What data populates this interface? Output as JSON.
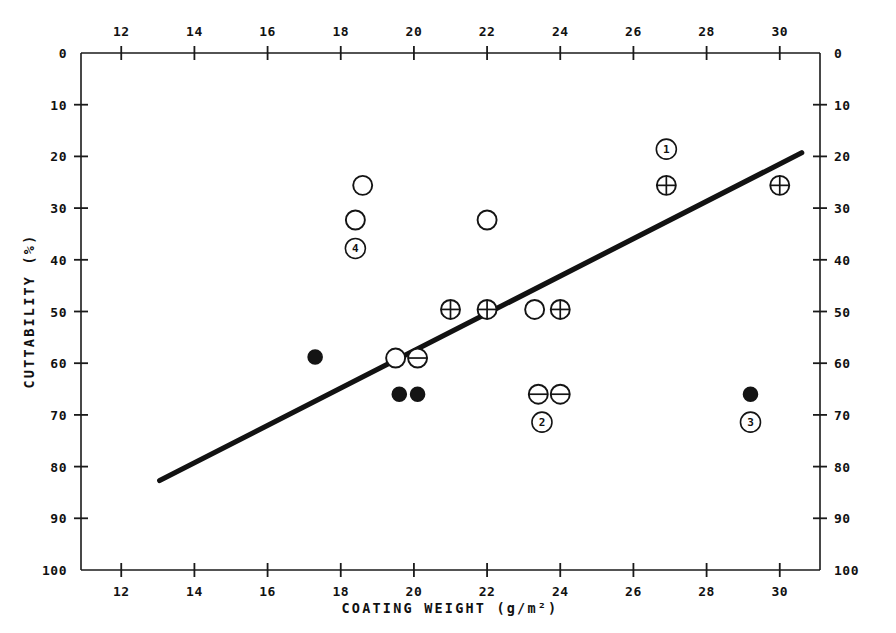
{
  "chart_data": {
    "type": "scatter",
    "title": "",
    "xlabel": "COATING WEIGHT   (g/m²)",
    "ylabel": "CUTTABILITY  (%)",
    "xlim": [
      10.9,
      31.1
    ],
    "ylim": [
      0,
      100
    ],
    "y_inverted": true,
    "grid": false,
    "legend_position": "none",
    "x_ticks": [
      12,
      14,
      16,
      18,
      20,
      22,
      24,
      26,
      28,
      30
    ],
    "x_tick_labels": [
      "12",
      "14",
      "16",
      "18",
      "20",
      "22",
      "24",
      "26",
      "28",
      "30"
    ],
    "y_ticks": [
      0,
      10,
      20,
      30,
      40,
      50,
      60,
      70,
      80,
      90,
      100
    ],
    "y_tick_labels": [
      "0",
      "10",
      "20",
      "30",
      "40",
      "50",
      "60",
      "70",
      "80",
      "90",
      "100"
    ],
    "x_axis_top_mirrored": true,
    "y_axis_right_mirrored": true,
    "series": [
      {
        "name": "open-circle",
        "marker": "open-circle",
        "points": [
          {
            "x": 18.6,
            "y": 25.6
          },
          {
            "x": 18.4,
            "y": 32.3
          },
          {
            "x": 22.0,
            "y": 32.3
          },
          {
            "x": 19.5,
            "y": 59.0
          },
          {
            "x": 23.3,
            "y": 49.6
          }
        ]
      },
      {
        "name": "circle-plus",
        "marker": "circle-plus",
        "points": [
          {
            "x": 26.9,
            "y": 25.6
          },
          {
            "x": 30.0,
            "y": 25.6
          },
          {
            "x": 21.0,
            "y": 49.6
          },
          {
            "x": 22.0,
            "y": 49.6
          },
          {
            "x": 24.0,
            "y": 49.6
          }
        ]
      },
      {
        "name": "circle-minus",
        "marker": "circle-minus",
        "points": [
          {
            "x": 20.1,
            "y": 59.0
          },
          {
            "x": 23.4,
            "y": 66.0
          },
          {
            "x": 24.0,
            "y": 66.0
          }
        ]
      },
      {
        "name": "filled-circle",
        "marker": "filled-circle",
        "points": [
          {
            "x": 17.3,
            "y": 58.8
          },
          {
            "x": 19.6,
            "y": 66.0
          },
          {
            "x": 20.1,
            "y": 66.0
          },
          {
            "x": 29.2,
            "y": 66.0
          }
        ]
      }
    ],
    "annotations": [
      {
        "label": "1",
        "x": 26.9,
        "y": 18.6,
        "style": "circled-number"
      },
      {
        "label": "4",
        "x": 18.4,
        "y": 37.8,
        "style": "circled-number"
      },
      {
        "label": "2",
        "x": 23.5,
        "y": 71.4,
        "style": "circled-number"
      },
      {
        "label": "3",
        "x": 29.2,
        "y": 71.4,
        "style": "circled-number"
      }
    ],
    "fit_line": {
      "name": "regression-line",
      "x_start": 13.05,
      "y_start": 82.7,
      "x_end": 30.6,
      "y_end": 19.3
    }
  }
}
